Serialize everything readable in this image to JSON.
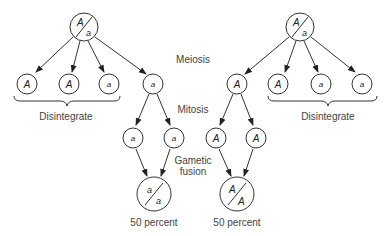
{
  "labels": {
    "meiosis": "Meiosis",
    "mitosis": "Mitosis",
    "gametic_fusion_line1": "Gametic",
    "gametic_fusion_line2": "fusion",
    "disintegrate_left": "Disintegrate",
    "disintegrate_right": "Disintegrate",
    "result_left": "50 percent",
    "result_right": "50 percent"
  },
  "parents": {
    "left": {
      "top": "A",
      "bottom": "a"
    },
    "right": {
      "top": "A",
      "bottom": "a"
    }
  },
  "meiosis_products": {
    "left": [
      "A",
      "A",
      "a",
      "a"
    ],
    "right": [
      "A",
      "A",
      "a",
      "a"
    ]
  },
  "mitosis_products": [
    "a",
    "a",
    "A",
    "A"
  ],
  "offspring": {
    "left": {
      "top": "a",
      "bottom": "a"
    },
    "right": {
      "top": "A",
      "bottom": "A"
    }
  }
}
